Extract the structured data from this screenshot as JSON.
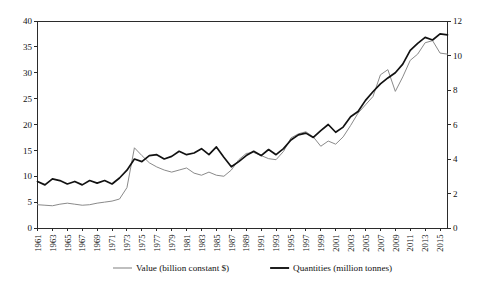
{
  "chart_data": {
    "type": "line",
    "title": "",
    "xlabel": "",
    "ylabel": "",
    "y2label": "",
    "grid": false,
    "legend_position": "bottom",
    "x": [
      1961,
      1962,
      1963,
      1964,
      1965,
      1966,
      1967,
      1968,
      1969,
      1970,
      1971,
      1972,
      1973,
      1974,
      1975,
      1976,
      1977,
      1978,
      1979,
      1980,
      1981,
      1982,
      1983,
      1984,
      1985,
      1986,
      1987,
      1988,
      1989,
      1990,
      1991,
      1992,
      1993,
      1994,
      1995,
      1996,
      1997,
      1998,
      1999,
      2000,
      2001,
      2002,
      2003,
      2004,
      2005,
      2006,
      2007,
      2008,
      2009,
      2010,
      2011,
      2012,
      2013,
      2014,
      2015,
      2016
    ],
    "xtick_labels": [
      "1961",
      "1963",
      "1965",
      "1967",
      "1969",
      "1971",
      "1973",
      "1975",
      "1977",
      "1979",
      "1981",
      "1983",
      "1985",
      "1987",
      "1989",
      "1991",
      "1993",
      "1995",
      "1997",
      "1999",
      "2001",
      "2003",
      "2005",
      "2007",
      "2009",
      "2011",
      "2013",
      "2015"
    ],
    "ylim": [
      0,
      40
    ],
    "yticks": [
      0,
      5,
      10,
      15,
      20,
      25,
      30,
      35,
      40
    ],
    "y2lim": [
      0,
      12
    ],
    "y2ticks": [
      0,
      2,
      4,
      6,
      8,
      10,
      12
    ],
    "series": [
      {
        "name": "Value (billion constant $)",
        "axis": "left",
        "color": "#8a8a8a",
        "width": "thin",
        "values": [
          4.5,
          4.4,
          4.3,
          4.6,
          4.8,
          4.6,
          4.4,
          4.5,
          4.8,
          5.0,
          5.2,
          5.6,
          7.8,
          15.5,
          14.0,
          12.6,
          11.8,
          11.2,
          10.8,
          11.2,
          11.6,
          10.6,
          10.2,
          10.8,
          10.2,
          10.0,
          11.2,
          13.2,
          14.4,
          14.6,
          14.0,
          13.4,
          13.2,
          14.8,
          17.4,
          18.2,
          18.6,
          17.6,
          15.8,
          16.8,
          16.2,
          17.6,
          19.8,
          22.2,
          23.8,
          25.4,
          29.6,
          30.6,
          26.4,
          29.2,
          32.4,
          33.6,
          35.8,
          36.2,
          33.8,
          33.6
        ]
      },
      {
        "name": "Quantities (million tonnes)",
        "axis": "right",
        "color": "#121212",
        "width": "thick",
        "values": [
          2.7,
          2.5,
          2.85,
          2.75,
          2.55,
          2.7,
          2.5,
          2.75,
          2.6,
          2.75,
          2.55,
          2.9,
          3.35,
          4.0,
          3.85,
          4.2,
          4.25,
          4.0,
          4.15,
          4.45,
          4.25,
          4.35,
          4.6,
          4.25,
          4.7,
          4.1,
          3.55,
          3.85,
          4.2,
          4.45,
          4.2,
          4.55,
          4.25,
          4.6,
          5.1,
          5.4,
          5.5,
          5.25,
          5.65,
          6.0,
          5.55,
          5.85,
          6.45,
          6.75,
          7.4,
          7.9,
          8.35,
          8.7,
          9.0,
          9.5,
          10.3,
          10.7,
          11.05,
          10.9,
          11.25,
          11.2
        ]
      }
    ],
    "legend": [
      {
        "label": "Value (billion constant $)",
        "style": "thin"
      },
      {
        "label": "Quantities (million tonnes)",
        "style": "thick"
      }
    ]
  }
}
